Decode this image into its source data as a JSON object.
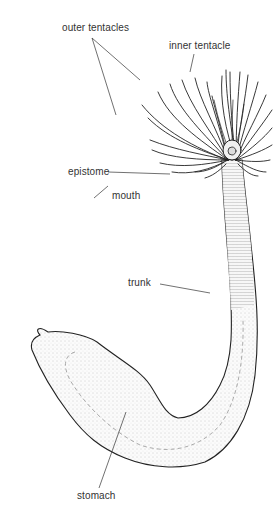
{
  "diagram": {
    "labels": {
      "outer_tentacles": "outer tentacles",
      "inner_tentacle": "inner tentacle",
      "epistome": "epistome",
      "mouth": "mouth",
      "trunk": "trunk",
      "stomach": "stomach"
    },
    "colors": {
      "line": "#222222",
      "fill": "#f4f4f4",
      "text": "#333333"
    }
  }
}
